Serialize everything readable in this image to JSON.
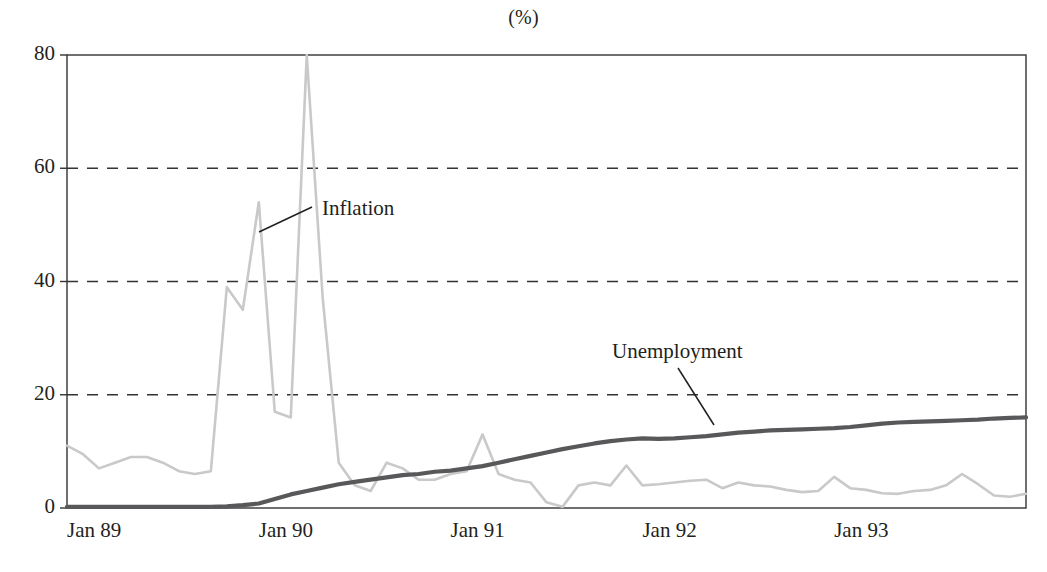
{
  "chart_data": {
    "type": "line",
    "title": "(%)",
    "xlabel": "",
    "ylabel": "",
    "ylim": [
      0,
      80
    ],
    "yticks": [
      0,
      20,
      40,
      60,
      80
    ],
    "ytick_labels": [
      "0",
      "20",
      "40",
      "60",
      "80"
    ],
    "xtick_labels": [
      "Jan 89",
      "Jan 90",
      "Jan 91",
      "Jan 92",
      "Jan 93"
    ],
    "xtick_indices": [
      0,
      12,
      24,
      36,
      48
    ],
    "x_count": 61,
    "grid": "horizontal dashed at 20, 40, 60",
    "legend_position": "inline annotations with leader lines",
    "annotations": [
      {
        "label": "Inflation",
        "x_index": 15,
        "y_value": 51
      },
      {
        "label": "Unemployment",
        "x_index": 38,
        "y_value": 27
      }
    ],
    "series": [
      {
        "name": "Inflation",
        "color": "#c9c9c9",
        "values": [
          11,
          9.5,
          7,
          8,
          9,
          9,
          8,
          6.5,
          6,
          6.5,
          39,
          35,
          54,
          17,
          16,
          80,
          37,
          8,
          4,
          3,
          8,
          7,
          5,
          5,
          6,
          6.5,
          13,
          6,
          5,
          4.5,
          1,
          0.2,
          4,
          4.5,
          4,
          7.5,
          4,
          4.2,
          4.5,
          4.8,
          5,
          3.5,
          4.5,
          4,
          3.8,
          3.2,
          2.8,
          3,
          5.5,
          3.5,
          3.2,
          2.6,
          2.5,
          3,
          3.2,
          4,
          6,
          4.2,
          2.2,
          2,
          2.5
        ]
      },
      {
        "name": "Unemployment",
        "color": "#58585a",
        "values": [
          0.2,
          0.2,
          0.2,
          0.2,
          0.2,
          0.2,
          0.2,
          0.2,
          0.2,
          0.2,
          0.3,
          0.5,
          0.8,
          1.6,
          2.4,
          3.0,
          3.6,
          4.2,
          4.6,
          5.0,
          5.4,
          5.8,
          6.0,
          6.4,
          6.6,
          7.0,
          7.4,
          8.0,
          8.6,
          9.2,
          9.8,
          10.4,
          10.9,
          11.4,
          11.8,
          12.1,
          12.3,
          12.2,
          12.3,
          12.5,
          12.7,
          13.0,
          13.3,
          13.5,
          13.7,
          13.8,
          13.9,
          14.0,
          14.1,
          14.3,
          14.6,
          14.9,
          15.1,
          15.2,
          15.3,
          15.4,
          15.5,
          15.6,
          15.8,
          15.9,
          16.0
        ]
      }
    ]
  },
  "axes": {
    "frame_color": "#333333",
    "gridline_color": "#333333"
  }
}
